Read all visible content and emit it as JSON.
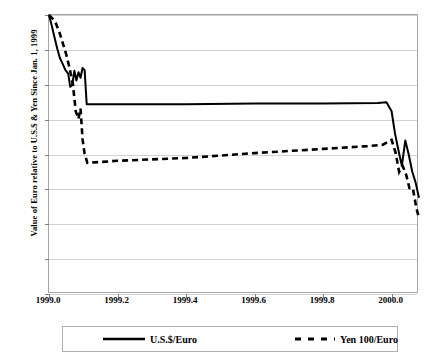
{
  "chart_data": {
    "type": "line",
    "title": "",
    "xlabel": "",
    "ylabel": "Value of Euro relative to U.S.$ & Yen Since Jan. 1, 1999",
    "xlim": [
      1999.0,
      2000.08
    ],
    "ylim": [
      0.6,
      1.0
    ],
    "grid": true,
    "legend_position": "bottom",
    "xticks": [
      "1999.0",
      "1999.2",
      "1999.4",
      "1999.6",
      "1999.8",
      "2000.0"
    ],
    "xtick_values": [
      1999.0,
      1999.2,
      1999.4,
      1999.6,
      1999.8,
      2000.0
    ],
    "yticks": [
      "0.6",
      "0.65",
      "0.7",
      "0.75",
      "0.8",
      "0.85",
      "0.9",
      "0.95",
      "1"
    ],
    "ytick_values": [
      0.6,
      0.65,
      0.7,
      0.75,
      0.8,
      0.85,
      0.9,
      0.95,
      1.0
    ],
    "series": [
      {
        "name": "U.S.$/Euro",
        "style": "solid",
        "color": "#000000",
        "x": [
          1999.0,
          1999.008,
          1999.016,
          1999.024,
          1999.032,
          1999.04,
          1999.048,
          1999.056,
          1999.062,
          1999.068,
          1999.074,
          1999.08,
          1999.086,
          1999.092,
          1999.098,
          1999.104,
          1999.11,
          1999.2,
          1999.4,
          1999.6,
          1999.8,
          1999.96,
          1999.985,
          2000.0,
          2000.01,
          2000.02,
          2000.03,
          2000.04,
          2000.05,
          2000.06,
          2000.07,
          2000.08
        ],
        "y": [
          1.0,
          0.985,
          0.968,
          0.952,
          0.938,
          0.93,
          0.921,
          0.916,
          0.897,
          0.9,
          0.92,
          0.906,
          0.918,
          0.91,
          0.924,
          0.921,
          0.872,
          0.872,
          0.872,
          0.873,
          0.873,
          0.874,
          0.875,
          0.862,
          0.83,
          0.806,
          0.784,
          0.82,
          0.8,
          0.776,
          0.76,
          0.738
        ]
      },
      {
        "name": "Yen 100/Euro",
        "style": "dashed",
        "color": "#000000",
        "x": [
          1999.0,
          1999.01,
          1999.02,
          1999.03,
          1999.04,
          1999.05,
          1999.06,
          1999.07,
          1999.078,
          1999.086,
          1999.092,
          1999.098,
          1999.104,
          1999.112,
          1999.2,
          1999.4,
          1999.6,
          1999.8,
          1999.93,
          1999.975,
          2000.0,
          2000.012,
          2000.022,
          2000.032,
          2000.042,
          2000.052,
          2000.062,
          2000.072,
          2000.08
        ],
        "y": [
          1.0,
          0.995,
          0.988,
          0.976,
          0.96,
          0.944,
          0.924,
          0.9,
          0.862,
          0.851,
          0.866,
          0.822,
          0.801,
          0.788,
          0.791,
          0.795,
          0.802,
          0.808,
          0.812,
          0.814,
          0.821,
          0.802,
          0.775,
          0.784,
          0.772,
          0.752,
          0.752,
          0.724,
          0.709
        ]
      }
    ]
  },
  "legend": {
    "entries": [
      {
        "label": "U.S.$/Euro",
        "style": "solid"
      },
      {
        "label": "Yen 100/Euro",
        "style": "dashed"
      }
    ]
  }
}
